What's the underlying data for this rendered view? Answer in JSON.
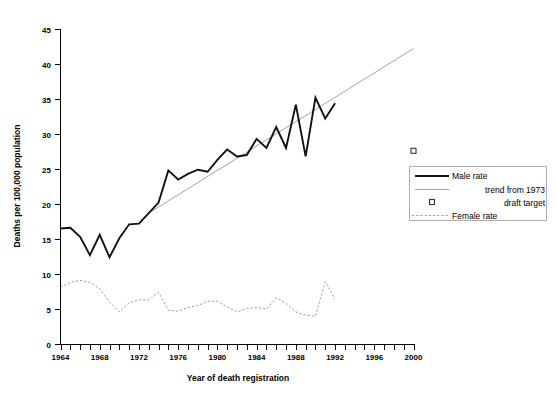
{
  "chart_data": {
    "type": "line",
    "title": "",
    "xlabel": "Year of death registration",
    "ylabel": "Deaths per 100,000 population",
    "xlim": [
      1964,
      2000
    ],
    "ylim": [
      0,
      45
    ],
    "ytick_step": 5,
    "xtick_step": 1,
    "xtick_label_step": 4,
    "grid": false,
    "legend_position": "right",
    "yticks": [
      0,
      5,
      10,
      15,
      20,
      25,
      30,
      35,
      40,
      45
    ],
    "xticks_labeled": [
      1964,
      1968,
      1972,
      1976,
      1980,
      1984,
      1988,
      1992,
      1996,
      2000
    ],
    "x": [
      1964,
      1965,
      1966,
      1967,
      1968,
      1969,
      1970,
      1971,
      1972,
      1973,
      1974,
      1975,
      1976,
      1977,
      1978,
      1979,
      1980,
      1981,
      1982,
      1983,
      1984,
      1985,
      1986,
      1987,
      1988,
      1989,
      1990,
      1991,
      1992
    ],
    "series": [
      {
        "name": "Male rate",
        "style": "solid-thick",
        "color": "#111111",
        "values": [
          16.5,
          16.6,
          15.3,
          12.7,
          15.6,
          12.4,
          15.1,
          17.1,
          17.2,
          18.7,
          20.2,
          24.8,
          23.5,
          24.3,
          24.9,
          24.6,
          26.3,
          27.8,
          26.8,
          27.0,
          29.3,
          28.0,
          31.0,
          28.0,
          34.2,
          26.8,
          35.2,
          32.2,
          34.4
        ]
      },
      {
        "name": "Female rate",
        "style": "dotted",
        "color": "#9a9a9a",
        "values": [
          8.1,
          8.8,
          9.1,
          8.8,
          7.9,
          6.0,
          4.6,
          5.9,
          6.3,
          6.3,
          7.4,
          4.8,
          4.7,
          5.2,
          5.5,
          6.1,
          6.1,
          5.3,
          4.6,
          5.1,
          5.2,
          5.0,
          6.6,
          5.8,
          4.6,
          4.1,
          4.0,
          8.9,
          6.4
        ]
      }
    ],
    "trend": {
      "name": "trend from 1973",
      "style": "thin-line",
      "color": "#8a8a8a",
      "x_start": 1973,
      "y_start": 18.7,
      "x_end": 2000,
      "y_end": 42.2
    },
    "draft_target": {
      "name": "draft target",
      "marker": "open-square",
      "x": 2000,
      "y": 27.6
    },
    "legend": [
      {
        "label": "Male rate",
        "swatch": "solid-thick-line"
      },
      {
        "label": "trend from 1973",
        "swatch": "thin-line"
      },
      {
        "label": "draft target",
        "swatch": "open-square"
      },
      {
        "label": "Female rate",
        "swatch": "dotted-line"
      }
    ]
  }
}
